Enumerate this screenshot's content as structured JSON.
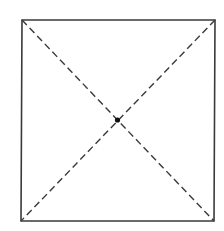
{
  "diagram": {
    "canvas": {
      "width": 224,
      "height": 231,
      "background": "#ffffff"
    },
    "stroke_color": "#3a3a3a",
    "square": {
      "corners": {
        "top_left": [
          22,
          20
        ],
        "top_right": [
          215,
          20
        ],
        "bottom_right": [
          214,
          221
        ],
        "bottom_left": [
          21,
          221
        ]
      },
      "stroke_width": 1.6,
      "style": "solid"
    },
    "diagonals": [
      {
        "name": "top-left-to-bottom-right",
        "from": [
          22,
          20
        ],
        "to": [
          214,
          221
        ],
        "style": "dashed",
        "dash": "7 4",
        "stroke_width": 1.4
      },
      {
        "name": "top-right-to-bottom-left",
        "from": [
          215,
          20
        ],
        "to": [
          21,
          221
        ],
        "style": "dashed",
        "dash": "7 4",
        "stroke_width": 1.4
      }
    ],
    "center_point": {
      "x": 117.5,
      "y": 120,
      "radius": 2.6,
      "fill": "#111111"
    }
  }
}
